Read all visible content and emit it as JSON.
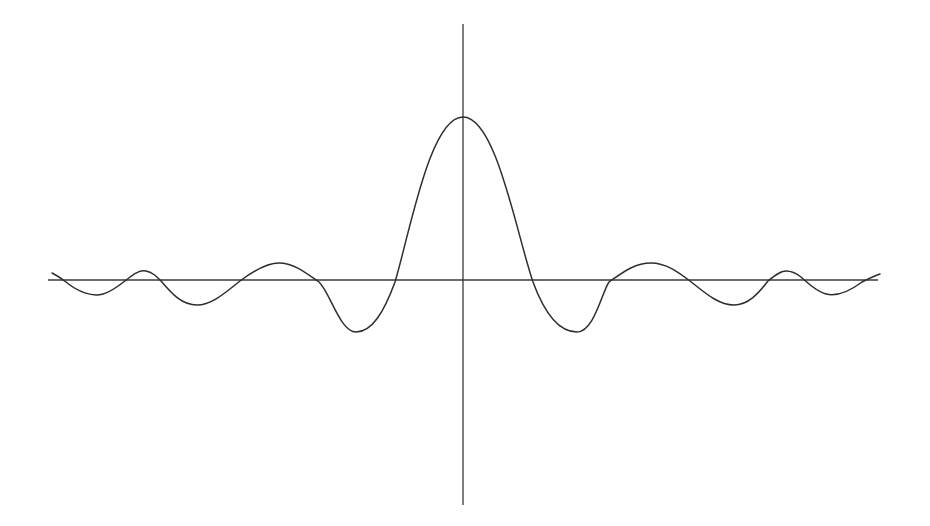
{
  "chart_data": {
    "type": "line",
    "title": "",
    "xlabel": "",
    "ylabel": "",
    "grid": false,
    "legend": null,
    "xlim": [
      -6.5,
      6.5
    ],
    "ylim": [
      -1.45,
      1.6
    ],
    "x": [
      -6.4,
      -6.0,
      -5.5,
      -5.0,
      -4.5,
      -4.0,
      -3.5,
      -3.0,
      -2.5,
      -2.0,
      -1.5,
      -1.0,
      -0.5,
      0,
      0.5,
      1.0,
      1.5,
      2.0,
      2.5,
      3.0,
      3.5,
      4.0,
      4.5,
      5.0,
      5.5,
      6.0,
      6.4
    ],
    "series": [
      {
        "name": "f(x)",
        "values": [
          0.04,
          0.0,
          -0.09,
          0.0,
          0.06,
          0.0,
          -0.16,
          0.0,
          0.11,
          0.0,
          -0.32,
          0.0,
          0.55,
          1.0,
          0.55,
          0.0,
          -0.32,
          0.0,
          0.11,
          0.0,
          -0.16,
          0.0,
          0.06,
          0.0,
          -0.09,
          0.0,
          0.04
        ]
      }
    ],
    "axes": {
      "x_axis_visible": true,
      "y_axis_visible": true,
      "ticks": false
    }
  },
  "svg": {
    "width": 930,
    "height": 526,
    "origin": {
      "x": 463,
      "y": 280
    },
    "x_axis": {
      "x1": 48,
      "x2": 878,
      "y": 280
    },
    "y_axis": {
      "x": 463,
      "y1": 24,
      "y2": 505
    },
    "curve_path": "M52,273 C58,276 62,279 66,282 C78,292 92,297 103,294 C114,291 122,283 130,277 C136,273 140,270 146,271 C152,272 156,276 161,281 C172,294 182,305 197,305 C212,305 226,292 240,281 C252,272 266,263 279,263 C294,263 306,273 319,282 C330,292 340,332 356,332 C372,332 384,312 395,282 C410,232 430,117 463,117 C496,117 516,232 533,282 C544,312 558,332 577,332 C594,332 602,292 609,282 C622,273 634,263 651,263 C666,263 678,272 690,281 C704,292 718,305 734,305 C748,305 758,294 768,281 C774,276 780,271 786,271 C792,271 796,273 801,277 C808,283 815,291 826,294 C838,297 850,291 862,282 C868,279 874,276 880,274",
    "stroke_color": "#2e2e2e",
    "axis_color": "#3a3a3a"
  }
}
